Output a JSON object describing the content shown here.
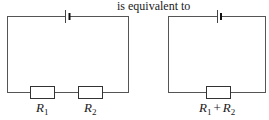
{
  "caption": "is equivalent to",
  "left_circuit": {
    "resistors": [
      {
        "symbol": "R",
        "subscript": "1"
      },
      {
        "symbol": "R",
        "subscript": "2"
      }
    ]
  },
  "right_circuit": {
    "resistor": {
      "terms": [
        {
          "symbol": "R",
          "subscript": "1"
        },
        {
          "symbol": "R",
          "subscript": "2"
        }
      ],
      "operator": "+"
    }
  },
  "colors": {
    "wire": "#555555",
    "ink": "#1a1a1a",
    "background": "#ffffff"
  }
}
